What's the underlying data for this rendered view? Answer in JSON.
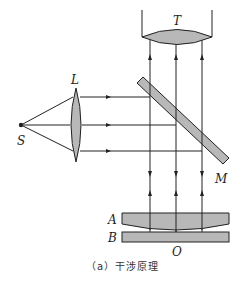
{
  "diagram": {
    "caption": "（a）干涉原理",
    "labels": {
      "source": "S",
      "lens": "L",
      "telescope": "T",
      "mirror": "M",
      "upper_plate": "A",
      "lower_plate": "B",
      "contact_point": "O"
    },
    "colors": {
      "stroke": "#222222",
      "fill": "#b8b8b8",
      "background": "#ffffff"
    },
    "rays": {
      "horizontal_y": [
        97,
        125,
        151
      ],
      "vertical_x": [
        150,
        176,
        202
      ]
    }
  }
}
